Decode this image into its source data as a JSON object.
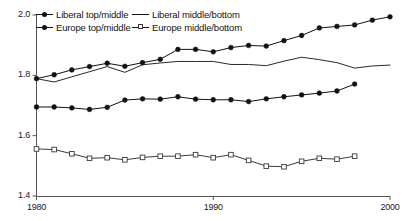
{
  "chart_data": {
    "type": "line",
    "title": "",
    "subtitle": "",
    "xlabel": "",
    "ylabel": "",
    "xlim": [
      1980,
      2000
    ],
    "ylim": [
      1.4,
      2.0
    ],
    "grid": false,
    "legend_position": "top-left",
    "x_ticks": [
      "1980",
      "1990",
      "2000"
    ],
    "x_tick_values": [
      1980,
      1990,
      2000
    ],
    "y_ticks": [
      "1.4",
      "1.6",
      "1.8",
      "2.0"
    ],
    "y_tick_values": [
      1.4,
      1.6,
      1.8,
      2.0
    ],
    "series": [
      {
        "name": "Liberal top/middle",
        "marker": "filled-circle",
        "color": "#111111",
        "x": [
          1980,
          1981,
          1982,
          1983,
          1984,
          1985,
          1986,
          1987,
          1988,
          1989,
          1990,
          1991,
          1992,
          1993,
          1994,
          1995,
          1996,
          1997,
          1998
        ],
        "values": [
          1.695,
          1.695,
          1.692,
          1.687,
          1.694,
          1.718,
          1.722,
          1.721,
          1.729,
          1.721,
          1.719,
          1.719,
          1.713,
          1.722,
          1.729,
          1.735,
          1.741,
          1.748,
          1.771
        ]
      },
      {
        "name": "Liberal middle/bottom",
        "marker": "none",
        "color": "#111111",
        "x": [
          1980,
          1981,
          1982,
          1983,
          1984,
          1985,
          1986,
          1987,
          1988,
          1989,
          1990,
          1991,
          1992,
          1993,
          1994,
          1995,
          1996,
          1997,
          1998,
          1999,
          2000
        ],
        "values": [
          1.789,
          1.778,
          1.795,
          1.812,
          1.829,
          1.81,
          1.835,
          1.841,
          1.846,
          1.846,
          1.846,
          1.836,
          1.836,
          1.832,
          1.847,
          1.86,
          1.852,
          1.842,
          1.824,
          1.831,
          1.834
        ]
      },
      {
        "name": "Europe top/middle",
        "marker": "filled-circle",
        "color": "#111111",
        "x": [
          1980,
          1981,
          1982,
          1983,
          1984,
          1985,
          1986,
          1987,
          1988,
          1989,
          1990,
          1991,
          1992,
          1993,
          1994,
          1995,
          1996,
          1997,
          1998,
          1999,
          2000
        ],
        "values": [
          1.789,
          1.802,
          1.818,
          1.829,
          1.84,
          1.83,
          1.842,
          1.853,
          1.886,
          1.886,
          1.878,
          1.892,
          1.899,
          1.897,
          1.915,
          1.932,
          1.957,
          1.962,
          1.967,
          1.983,
          1.994
        ]
      },
      {
        "name": "Europe middle/bottom",
        "marker": "open-square",
        "color": "#3a3a3a",
        "x": [
          1980,
          1981,
          1982,
          1983,
          1984,
          1985,
          1986,
          1987,
          1988,
          1989,
          1990,
          1991,
          1992,
          1993,
          1994,
          1995,
          1996,
          1997,
          1998
        ],
        "values": [
          1.556,
          1.554,
          1.54,
          1.525,
          1.527,
          1.52,
          1.528,
          1.532,
          1.532,
          1.537,
          1.527,
          1.537,
          1.518,
          1.499,
          1.497,
          1.515,
          1.525,
          1.522,
          1.532
        ]
      }
    ]
  },
  "legend": {
    "entries": [
      {
        "label": "Liberal top/middle",
        "glyph": "line-filled-circle"
      },
      {
        "label": "Liberal middle/bottom",
        "glyph": "line-plain"
      },
      {
        "label": "Europe top/middle",
        "glyph": "line-filled-circle"
      },
      {
        "label": "Europe middle/bottom",
        "glyph": "line-open-square"
      }
    ]
  },
  "axes": {
    "y_labels": [
      "2.0",
      "1.8",
      "1.6",
      "1.4"
    ],
    "x_labels": [
      "1980",
      "1990",
      "2000"
    ]
  },
  "colors": {
    "axis": "#555555",
    "line": "#111111",
    "open_marker_stroke": "#3a3a3a",
    "text": "#141414",
    "background": "#ffffff"
  }
}
